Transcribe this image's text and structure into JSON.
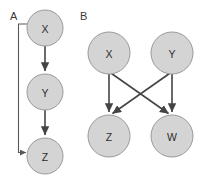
{
  "figure": {
    "background_color": "#ffffff",
    "node_fill_color": "#d4d4d4",
    "node_stroke_color": "#9a9a9a",
    "edge_color": "#444444",
    "label_color": "#2e2e2e"
  },
  "panels": [
    {
      "id": "panel-a",
      "label": "A",
      "label_x": 10,
      "label_y": 16,
      "node_radius": 18,
      "nodes": [
        {
          "id": "a-x",
          "label": "X",
          "cx": 45,
          "cy": 28
        },
        {
          "id": "a-y",
          "label": "Y",
          "cx": 45,
          "cy": 92
        },
        {
          "id": "a-z",
          "label": "Z",
          "cx": 45,
          "cy": 156
        }
      ],
      "edges": [
        {
          "id": "a-x-to-y",
          "from": "X",
          "to": "Y",
          "style": "straight"
        },
        {
          "id": "a-y-to-z",
          "from": "Y",
          "to": "Z",
          "style": "straight"
        },
        {
          "id": "a-x-to-z",
          "from": "X",
          "to": "Z",
          "style": "orthogonal-left-bypass"
        }
      ]
    },
    {
      "id": "panel-b",
      "label": "B",
      "label_x": 80,
      "label_y": 16,
      "node_radius": 21,
      "nodes": [
        {
          "id": "b-x",
          "label": "X",
          "cx": 109,
          "cy": 53
        },
        {
          "id": "b-y",
          "label": "Y",
          "cx": 172,
          "cy": 53
        },
        {
          "id": "b-z",
          "label": "Z",
          "cx": 109,
          "cy": 136
        },
        {
          "id": "b-w",
          "label": "W",
          "cx": 172,
          "cy": 136
        }
      ],
      "edges": [
        {
          "id": "b-x-to-z",
          "from": "X",
          "to": "Z",
          "style": "straight"
        },
        {
          "id": "b-x-to-w",
          "from": "X",
          "to": "W",
          "style": "diagonal"
        },
        {
          "id": "b-y-to-z",
          "from": "Y",
          "to": "Z",
          "style": "diagonal"
        },
        {
          "id": "b-y-to-w",
          "from": "Y",
          "to": "W",
          "style": "straight"
        }
      ]
    }
  ]
}
